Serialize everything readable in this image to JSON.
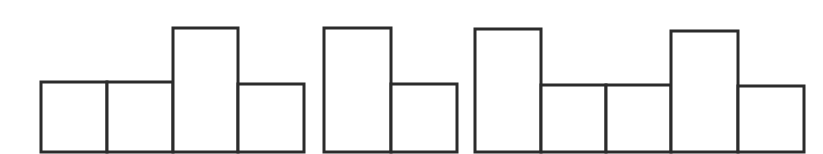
{
  "diagram": {
    "type": "block-bars",
    "colors": {
      "background": "#ffffff",
      "stroke": "#2b2b2b",
      "fill": "#ffffff"
    },
    "baseline_y": 152,
    "groups": [
      {
        "name": "group-1",
        "bars": [
          {
            "x": 41,
            "width": 66,
            "top": 82,
            "height_class": "short"
          },
          {
            "x": 107,
            "width": 66,
            "top": 82,
            "height_class": "short"
          },
          {
            "x": 173,
            "width": 65,
            "top": 28,
            "height_class": "tall"
          },
          {
            "x": 238,
            "width": 66,
            "top": 84,
            "height_class": "short"
          }
        ]
      },
      {
        "name": "group-2",
        "bars": [
          {
            "x": 324,
            "width": 67,
            "top": 28,
            "height_class": "tall"
          },
          {
            "x": 391,
            "width": 66,
            "top": 84,
            "height_class": "short"
          }
        ]
      },
      {
        "name": "group-3",
        "bars": [
          {
            "x": 475,
            "width": 66,
            "top": 29,
            "height_class": "tall"
          },
          {
            "x": 541,
            "width": 65,
            "top": 85,
            "height_class": "short"
          },
          {
            "x": 606,
            "width": 65,
            "top": 85,
            "height_class": "short"
          },
          {
            "x": 671,
            "width": 67,
            "top": 31,
            "height_class": "tall"
          },
          {
            "x": 738,
            "width": 66,
            "top": 86,
            "height_class": "short"
          }
        ]
      }
    ]
  }
}
